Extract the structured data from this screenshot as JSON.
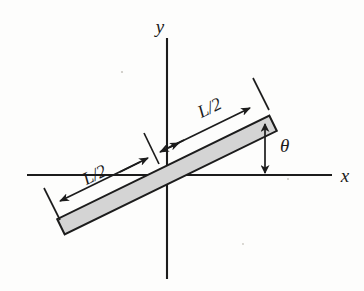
{
  "figure": {
    "background_color": "#fdfdfc",
    "ink_color": "#1c1c1c",
    "rod_fill_color": "#d4d4d4",
    "rod_edge_color": "#1c1c1c"
  },
  "axes": {
    "x_label": "x",
    "y_label": "y",
    "origin": {
      "x": 167,
      "y": 175
    },
    "x_axis": {
      "x1": 27,
      "y1": 175,
      "x2": 332,
      "y2": 175
    },
    "y_axis": {
      "x1": 167,
      "y1": 38,
      "x2": 167,
      "y2": 279
    }
  },
  "rod": {
    "name": "uniform-rod",
    "length_label": "L",
    "angle_deg": 26,
    "half_length_label": "L/2",
    "center": {
      "x": 167,
      "y": 175
    },
    "half_length_px": 118,
    "thickness_px": 17,
    "fill": "#d4d4d4"
  },
  "dimensions": [
    {
      "id": "upper-right-half",
      "label": "L/2",
      "label_x": 212,
      "label_y": 112,
      "label_rotation_deg": -26,
      "from": {
        "x": 168,
        "y": 148
      },
      "to": {
        "x": 252,
        "y": 107
      },
      "tick_at": {
        "x": 258,
        "y": 104
      }
    },
    {
      "id": "lower-left-half",
      "label": "L/2",
      "label_x": 96,
      "label_y": 179,
      "label_rotation_deg": -26,
      "from": {
        "x": 152,
        "y": 156
      },
      "to": {
        "x": 58,
        "y": 202
      },
      "tick_at": {
        "x": 51,
        "y": 206
      }
    }
  ],
  "angle": {
    "symbol": "θ",
    "label_x": 282,
    "label_y": 152,
    "arrow_x": 265,
    "arrow_top_y": 124,
    "arrow_bottom_y": 174
  },
  "ticks": [
    {
      "id": "center-tick",
      "x": 152,
      "y": 148,
      "length": 34,
      "angle_deg": -26
    },
    {
      "id": "right-end-tick",
      "x": 262,
      "y": 94,
      "length": 36,
      "angle_deg": -26
    },
    {
      "id": "left-end-tick",
      "x": 53,
      "y": 204,
      "length": 36,
      "angle_deg": -26
    }
  ]
}
